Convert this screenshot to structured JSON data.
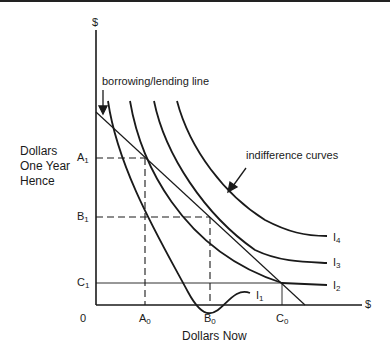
{
  "diagram": {
    "type": "indifference-curve diagram",
    "y_axis": {
      "unit": "$",
      "label": "Dollars One Year Hence",
      "label_lines": [
        "Dollars",
        "One Year",
        "Hence"
      ]
    },
    "x_axis": {
      "unit": "$",
      "label": "Dollars Now",
      "origin": "0"
    },
    "y_ticks": [
      {
        "base": "A",
        "sub": "1"
      },
      {
        "base": "B",
        "sub": "1"
      },
      {
        "base": "C",
        "sub": "1"
      }
    ],
    "x_ticks": [
      {
        "base": "A",
        "sub": "0"
      },
      {
        "base": "B",
        "sub": "0"
      },
      {
        "base": "C",
        "sub": "0"
      }
    ],
    "annotations": {
      "borrowing_lending": "borrowing/lending line",
      "indifference": "indifference curves"
    },
    "curves": [
      {
        "base": "I",
        "sub": "1"
      },
      {
        "base": "I",
        "sub": "2"
      },
      {
        "base": "I",
        "sub": "3"
      },
      {
        "base": "I",
        "sub": "4"
      }
    ],
    "colors": {
      "line": "#1a1a1a",
      "background": "#ffffff"
    }
  }
}
